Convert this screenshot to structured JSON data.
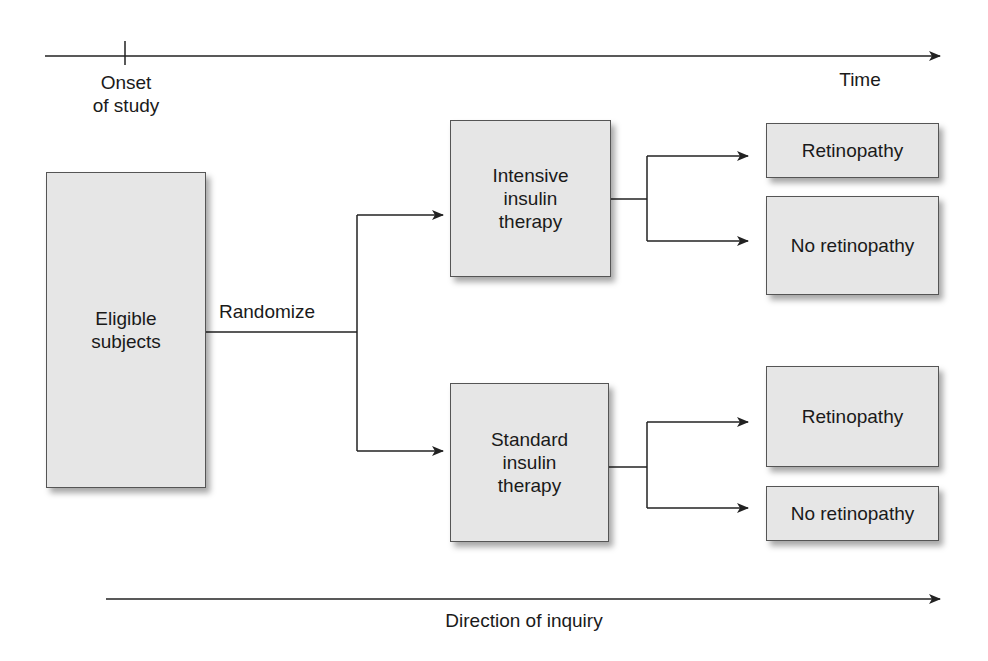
{
  "timeline": {
    "label": "Time",
    "onset_label": "Onset\nof study"
  },
  "inquiry": {
    "label": "Direction of inquiry"
  },
  "start": {
    "label": "Eligible\nsubjects"
  },
  "randomize": {
    "label": "Randomize"
  },
  "arms": [
    {
      "label": "Intensive\ninsulin\ntherapy",
      "outcomes": [
        {
          "label": "Retinopathy"
        },
        {
          "label": "No retinopathy"
        }
      ]
    },
    {
      "label": "Standard\ninsulin\ntherapy",
      "outcomes": [
        {
          "label": "Retinopathy"
        },
        {
          "label": "No retinopathy"
        }
      ]
    }
  ],
  "colors": {
    "box_fill": "#e6e6e6",
    "box_border": "#555555",
    "line": "#222222",
    "text": "#1a1a1a"
  }
}
